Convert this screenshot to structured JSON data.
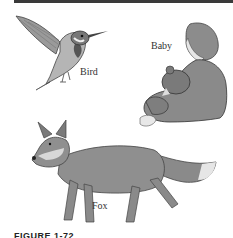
{
  "figure": {
    "labels": {
      "bird": "Bird",
      "baby": "Baby",
      "fox": "Fox"
    },
    "caption": "FIGURE 1-72"
  },
  "colors": {
    "bar": "#3a3a3a",
    "figure_gray": "#8a8a8a",
    "dark_gray": "#555555",
    "light_gray": "#cfcfcf"
  }
}
